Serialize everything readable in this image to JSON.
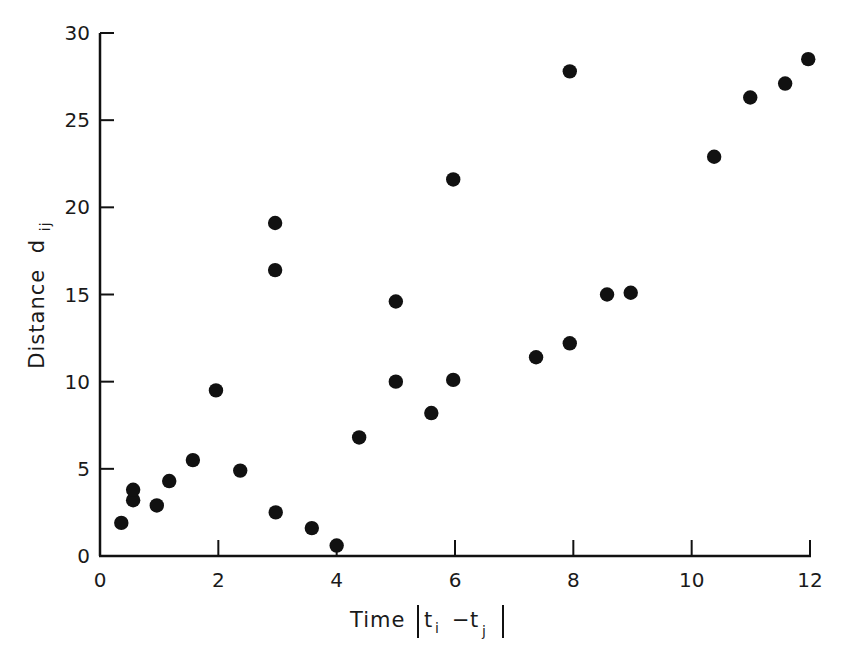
{
  "chart_data": {
    "type": "scatter",
    "title": "",
    "xlabel": "Time |t_i - t_j|",
    "ylabel": "Distance d_ij",
    "xlabel_parts": {
      "main": "Time",
      "t": "t",
      "i": "i",
      "minus": "−",
      "j": "j"
    },
    "ylabel_parts": {
      "main": "Distance",
      "d": "d",
      "sub": "ij"
    },
    "xlim": [
      0,
      12
    ],
    "ylim": [
      0,
      30
    ],
    "x_ticks": [
      0,
      2,
      4,
      6,
      8,
      10,
      12
    ],
    "y_ticks": [
      0,
      5,
      10,
      15,
      20,
      25,
      30
    ],
    "x_tick_labels": [
      "0",
      "2",
      "4",
      "6",
      "8",
      "10",
      "12"
    ],
    "y_tick_labels": [
      "0",
      "5",
      "10",
      "15",
      "20",
      "25",
      "30"
    ],
    "grid": false,
    "legend": null,
    "marker": {
      "shape": "filled-circle",
      "color": "#111111"
    },
    "points": [
      {
        "x": 0.36,
        "y": 1.9
      },
      {
        "x": 0.56,
        "y": 3.2
      },
      {
        "x": 0.56,
        "y": 3.8
      },
      {
        "x": 0.96,
        "y": 2.9
      },
      {
        "x": 1.17,
        "y": 4.3
      },
      {
        "x": 1.57,
        "y": 5.5
      },
      {
        "x": 1.96,
        "y": 9.5
      },
      {
        "x": 2.37,
        "y": 4.9
      },
      {
        "x": 2.96,
        "y": 19.1
      },
      {
        "x": 2.96,
        "y": 16.4
      },
      {
        "x": 2.97,
        "y": 2.5
      },
      {
        "x": 3.58,
        "y": 1.6
      },
      {
        "x": 4.0,
        "y": 0.6
      },
      {
        "x": 4.38,
        "y": 6.8
      },
      {
        "x": 5.0,
        "y": 14.6
      },
      {
        "x": 5.0,
        "y": 10.0
      },
      {
        "x": 5.6,
        "y": 8.2
      },
      {
        "x": 5.97,
        "y": 21.6
      },
      {
        "x": 5.97,
        "y": 10.1
      },
      {
        "x": 7.37,
        "y": 11.4
      },
      {
        "x": 7.94,
        "y": 12.2
      },
      {
        "x": 7.94,
        "y": 27.8
      },
      {
        "x": 8.57,
        "y": 15.0
      },
      {
        "x": 8.97,
        "y": 15.1
      },
      {
        "x": 10.38,
        "y": 22.9
      },
      {
        "x": 10.99,
        "y": 26.3
      },
      {
        "x": 11.58,
        "y": 27.1
      },
      {
        "x": 11.97,
        "y": 28.5
      }
    ]
  },
  "colors": {
    "ink": "#111111",
    "background": "#ffffff"
  }
}
